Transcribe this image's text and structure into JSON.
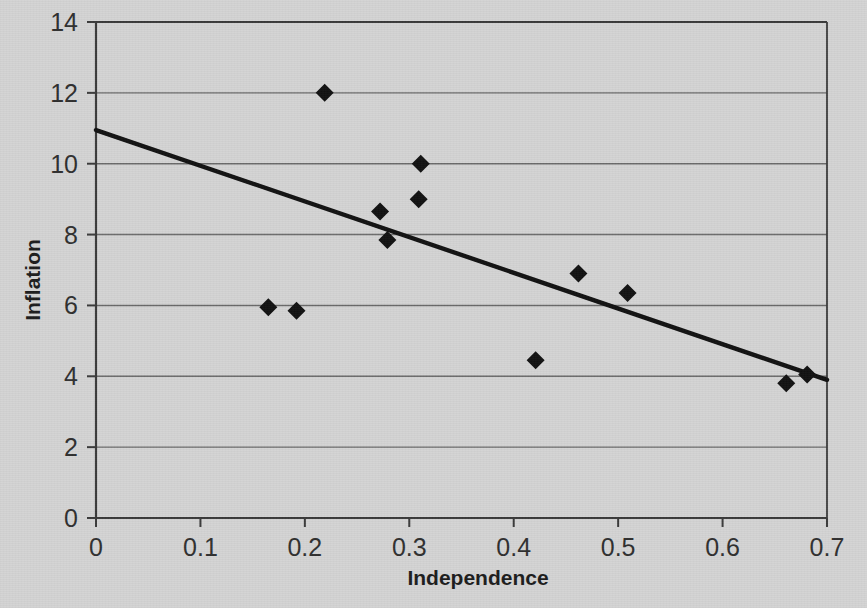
{
  "chart_data": {
    "type": "scatter",
    "title": "",
    "xlabel": "Independence",
    "ylabel": "Inflation",
    "xlim": [
      0,
      0.7
    ],
    "ylim": [
      0,
      14
    ],
    "xticks": [
      "0",
      "0.1",
      "0.2",
      "0.3",
      "0.4",
      "0.5",
      "0.6",
      "0.7"
    ],
    "xtick_values": [
      0,
      0.1,
      0.2,
      0.3,
      0.4,
      0.5,
      0.6,
      0.7
    ],
    "yticks": [
      "0",
      "2",
      "4",
      "6",
      "8",
      "10",
      "12",
      "14"
    ],
    "ytick_values": [
      0,
      2,
      4,
      6,
      8,
      10,
      12,
      14
    ],
    "grid": "horizontal",
    "legend": "none",
    "marker": "diamond",
    "marker_color": "#111111",
    "points": [
      {
        "x": 0.165,
        "y": 5.95
      },
      {
        "x": 0.192,
        "y": 5.85
      },
      {
        "x": 0.219,
        "y": 12.0
      },
      {
        "x": 0.272,
        "y": 8.65
      },
      {
        "x": 0.279,
        "y": 7.85
      },
      {
        "x": 0.309,
        "y": 9.0
      },
      {
        "x": 0.311,
        "y": 10.0
      },
      {
        "x": 0.421,
        "y": 4.45
      },
      {
        "x": 0.462,
        "y": 6.9
      },
      {
        "x": 0.509,
        "y": 6.35
      },
      {
        "x": 0.661,
        "y": 3.8
      },
      {
        "x": 0.681,
        "y": 4.05
      }
    ],
    "trendline": {
      "type": "linear",
      "x_start": 0.0,
      "y_start": 10.95,
      "x_end": 0.7,
      "y_end": 3.9,
      "color": "#111111"
    },
    "colors": {
      "background": "#d4d4d4",
      "axis": "#3a3a3a",
      "gridline": "#6b6b6b",
      "marker": "#111111",
      "trendline": "#111111",
      "text": "#2a2a2a"
    }
  }
}
